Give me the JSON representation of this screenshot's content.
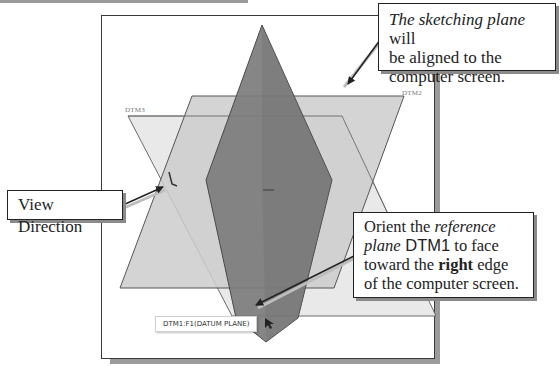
{
  "figure": {
    "viewport": {
      "planes": [
        {
          "name": "DTM3",
          "label": "DTM3",
          "fill": "#e9e9e9",
          "stroke": "#6a6a6a"
        },
        {
          "name": "DTM2",
          "label": "DTM2",
          "fill": "#c8c8c8",
          "stroke": "#555555"
        },
        {
          "name": "DTM1",
          "label": "DTM1",
          "fill": "#7f7f7f",
          "stroke": "#4a4a4a"
        }
      ],
      "tooltip": "DTM1:F1(DATUM PLANE)"
    },
    "callouts": {
      "sketching_plane": {
        "italic": "The sketching plane",
        "line1_rest": " will",
        "line2": "be aligned to the",
        "line3": "computer screen."
      },
      "view_direction": {
        "text": "View Direction"
      },
      "orient_reference": {
        "line1_plain": "Orient the ",
        "line1_italic": "reference",
        "line2_italic": "plane",
        "line2_sans": " DTM1",
        "line2_rest": " to face",
        "line3_plain": "toward the ",
        "line3_bold": "right",
        "line3_rest": " edge",
        "line4": "of the computer screen."
      }
    },
    "colors": {
      "frame_border": "#3a3a3a",
      "frame_shadow": "#9b9b9b",
      "arrow": "#222222"
    }
  }
}
